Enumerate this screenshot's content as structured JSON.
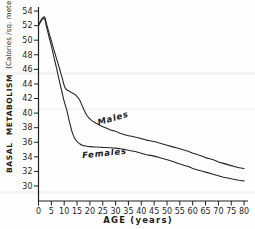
{
  "figure": {
    "background": "#fefefe",
    "ink_color": "#1f1f1f"
  },
  "chart_data": {
    "type": "line",
    "title": "",
    "xlabel": "AGE (years)",
    "ylabel": "BASAL METABOLISM (Calories /sq. meter/hour')",
    "ylabel_main": "BASAL METABOLISM",
    "ylabel_units": "(Calories /sq. meter/hour')",
    "xlim": [
      0,
      80
    ],
    "ylim": [
      30,
      54
    ],
    "x_ticks": [
      0,
      5,
      10,
      15,
      20,
      25,
      30,
      35,
      40,
      45,
      50,
      55,
      60,
      65,
      70,
      75,
      80
    ],
    "y_ticks": [
      30,
      32,
      34,
      36,
      38,
      40,
      42,
      44,
      46,
      48,
      50,
      52,
      54
    ],
    "grid": false,
    "legend_position": "inline-curve-labels",
    "series": [
      {
        "name": "Males",
        "points": [
          [
            0,
            52.0
          ],
          [
            1,
            52.8
          ],
          [
            2,
            53.2
          ],
          [
            2.5,
            53.1
          ],
          [
            3,
            52.4
          ],
          [
            4,
            51.1
          ],
          [
            5,
            49.9
          ],
          [
            6,
            48.7
          ],
          [
            7,
            47.5
          ],
          [
            8,
            46.3
          ],
          [
            9,
            45.1
          ],
          [
            10,
            43.8
          ],
          [
            10.5,
            43.4
          ],
          [
            11,
            43.2
          ],
          [
            12,
            43.0
          ],
          [
            13,
            42.8
          ],
          [
            14,
            42.6
          ],
          [
            15,
            42.3
          ],
          [
            16,
            41.8
          ],
          [
            17,
            41.0
          ],
          [
            18,
            40.2
          ],
          [
            19,
            39.6
          ],
          [
            20,
            39.2
          ],
          [
            21,
            38.9
          ],
          [
            22,
            38.7
          ],
          [
            24,
            38.3
          ],
          [
            26,
            38.0
          ],
          [
            28,
            37.7
          ],
          [
            30,
            37.5
          ],
          [
            32,
            37.2
          ],
          [
            35,
            36.9
          ],
          [
            38,
            36.7
          ],
          [
            40,
            36.5
          ],
          [
            42,
            36.3
          ],
          [
            45,
            36.1
          ],
          [
            48,
            35.8
          ],
          [
            50,
            35.6
          ],
          [
            52,
            35.4
          ],
          [
            55,
            35.1
          ],
          [
            58,
            34.8
          ],
          [
            60,
            34.5
          ],
          [
            62,
            34.3
          ],
          [
            65,
            33.9
          ],
          [
            68,
            33.6
          ],
          [
            70,
            33.3
          ],
          [
            72,
            33.1
          ],
          [
            75,
            32.8
          ],
          [
            78,
            32.5
          ],
          [
            80,
            32.4
          ]
        ]
      },
      {
        "name": "Females",
        "points": [
          [
            0,
            52.0
          ],
          [
            1,
            52.6
          ],
          [
            2,
            53.0
          ],
          [
            2.5,
            52.8
          ],
          [
            3,
            52.0
          ],
          [
            4,
            50.6
          ],
          [
            5,
            49.2
          ],
          [
            6,
            47.7
          ],
          [
            7,
            46.2
          ],
          [
            8,
            44.6
          ],
          [
            9,
            43.1
          ],
          [
            10,
            41.6
          ],
          [
            11,
            40.4
          ],
          [
            12,
            38.9
          ],
          [
            13,
            37.5
          ],
          [
            14,
            36.6
          ],
          [
            15,
            36.1
          ],
          [
            16,
            35.8
          ],
          [
            17,
            35.6
          ],
          [
            18,
            35.5
          ],
          [
            20,
            35.4
          ],
          [
            22,
            35.35
          ],
          [
            25,
            35.3
          ],
          [
            28,
            35.25
          ],
          [
            30,
            35.2
          ],
          [
            32,
            35.1
          ],
          [
            35,
            34.9
          ],
          [
            38,
            34.7
          ],
          [
            40,
            34.5
          ],
          [
            42,
            34.3
          ],
          [
            45,
            34.1
          ],
          [
            48,
            33.8
          ],
          [
            50,
            33.6
          ],
          [
            52,
            33.4
          ],
          [
            55,
            33.0
          ],
          [
            58,
            32.7
          ],
          [
            60,
            32.4
          ],
          [
            62,
            32.2
          ],
          [
            65,
            31.9
          ],
          [
            68,
            31.6
          ],
          [
            70,
            31.4
          ],
          [
            72,
            31.2
          ],
          [
            75,
            31.0
          ],
          [
            78,
            30.8
          ],
          [
            80,
            30.7
          ]
        ]
      }
    ]
  }
}
